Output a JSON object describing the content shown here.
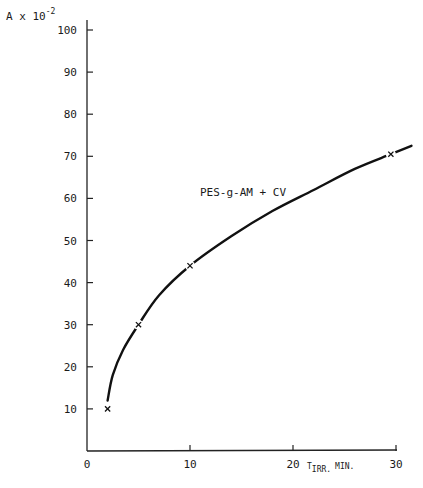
{
  "chart_data": {
    "type": "line",
    "title": "",
    "annotation": "PES-g-AM + CV",
    "ylabel": "A x 10",
    "ylabel_exponent": "-2",
    "xlabel": "T",
    "xlabel_subscript": "IRR.",
    "xlabel_unit": "MIN.",
    "xlim": [
      0,
      30
    ],
    "ylim": [
      0,
      100
    ],
    "x_ticks": [
      "0",
      "10",
      "20",
      "30"
    ],
    "y_ticks": [
      "10",
      "20",
      "30",
      "40",
      "50",
      "60",
      "70",
      "80",
      "90",
      "100"
    ],
    "grid": false,
    "legend": null,
    "series": [
      {
        "name": "PES-g-AM + CV",
        "markers": "x",
        "points": [
          {
            "x": 2,
            "y": 10
          },
          {
            "x": 5,
            "y": 30
          },
          {
            "x": 10,
            "y": 44
          },
          {
            "x": 29.5,
            "y": 70.5
          }
        ],
        "curve": [
          {
            "x": 2,
            "y": 12
          },
          {
            "x": 2.5,
            "y": 18
          },
          {
            "x": 3.5,
            "y": 24
          },
          {
            "x": 5,
            "y": 30
          },
          {
            "x": 7,
            "y": 37
          },
          {
            "x": 10,
            "y": 44
          },
          {
            "x": 14,
            "y": 51
          },
          {
            "x": 18,
            "y": 57
          },
          {
            "x": 22,
            "y": 62
          },
          {
            "x": 26,
            "y": 67
          },
          {
            "x": 29.5,
            "y": 70.5
          },
          {
            "x": 31.5,
            "y": 72.5
          }
        ]
      }
    ]
  }
}
